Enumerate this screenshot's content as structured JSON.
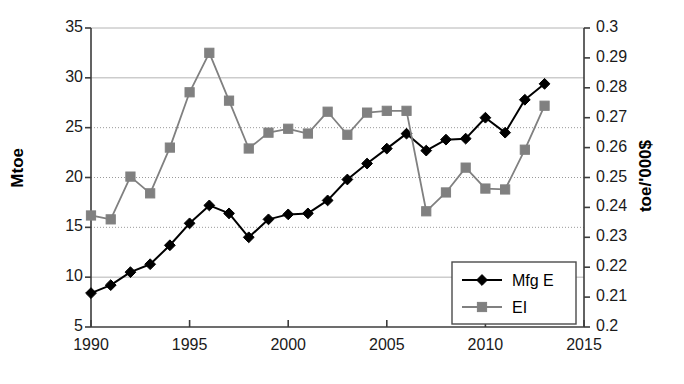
{
  "chart_data": {
    "type": "line",
    "title": "",
    "xlabel": "",
    "x": [
      1990,
      1991,
      1992,
      1993,
      1994,
      1995,
      1996,
      1997,
      1998,
      1999,
      2000,
      2001,
      2002,
      2003,
      2004,
      2005,
      2006,
      2007,
      2008,
      2009,
      2010,
      2011,
      2012,
      2013
    ],
    "xlim": [
      1990,
      2015
    ],
    "xticks": [
      1990,
      1995,
      2000,
      2005,
      2010,
      2015
    ],
    "xtick_labels": [
      "1990",
      "1995",
      "2000",
      "2005",
      "2010",
      "2015"
    ],
    "grid": true,
    "legend_position": "lower-right",
    "axes": [
      {
        "id": "left",
        "label": "Mtoe",
        "lim": [
          5,
          35
        ],
        "ticks": [
          5,
          10,
          15,
          20,
          25,
          30,
          35
        ],
        "tick_labels": [
          "5",
          "10",
          "15",
          "20",
          "25",
          "30",
          "35"
        ]
      },
      {
        "id": "right",
        "label": "toe/'000$",
        "lim": [
          0.2,
          0.3
        ],
        "ticks": [
          0.2,
          0.21,
          0.22,
          0.23,
          0.24,
          0.25,
          0.26,
          0.27,
          0.28,
          0.29,
          0.3
        ],
        "tick_labels": [
          "0.2",
          "0.21",
          "0.22",
          "0.23",
          "0.24",
          "0.25",
          "0.26",
          "0.27",
          "0.28",
          "0.29",
          "0.3"
        ]
      }
    ],
    "series": [
      {
        "name": "Mfg E",
        "axis": "left",
        "unit": "Mtoe",
        "color": "#000000",
        "marker": "diamond",
        "values": [
          8.4,
          9.2,
          10.5,
          11.3,
          13.2,
          15.4,
          17.2,
          16.4,
          14.0,
          15.8,
          16.3,
          16.4,
          17.7,
          19.8,
          21.4,
          22.9,
          24.4,
          22.7,
          23.8,
          23.9,
          26.0,
          24.5,
          27.8,
          29.4
        ]
      },
      {
        "name": "EI",
        "axis": "right",
        "unit": "toe/'000$",
        "color": "#808080",
        "marker": "square",
        "values": [
          0.2373,
          0.236,
          0.2503,
          0.2447,
          0.26,
          0.2785,
          0.2917,
          0.2757,
          0.2597,
          0.265,
          0.2663,
          0.2647,
          0.272,
          0.2643,
          0.2717,
          0.2723,
          0.2723,
          0.2387,
          0.245,
          0.2533,
          0.2463,
          0.246,
          0.2593,
          0.274
        ]
      }
    ],
    "series_values_on_left_scale": {
      "EI": [
        16.2,
        15.8,
        20.1,
        18.4,
        23.0,
        28.5,
        32.5,
        27.7,
        22.9,
        24.5,
        24.9,
        24.4,
        26.6,
        24.3,
        26.5,
        26.7,
        26.7,
        16.6,
        18.5,
        21.0,
        19.0,
        18.8,
        22.8,
        27.2
      ]
    }
  },
  "legend": {
    "items": [
      {
        "label": "Mfg E",
        "marker": "diamond",
        "color": "#000000"
      },
      {
        "label": "EI",
        "marker": "square",
        "color": "#808080"
      }
    ]
  }
}
